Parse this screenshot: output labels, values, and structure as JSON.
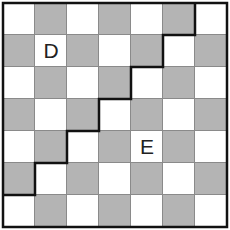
{
  "grid": {
    "rows": 7,
    "cols": 7,
    "cell_size": 32,
    "origin": [
      3,
      3
    ],
    "pattern": "checkerboard",
    "top_left_color": "white",
    "colors": {
      "light": "#ffffff",
      "dark": "#b4b4b4",
      "line": "#8a8a8a",
      "border": "#111111"
    }
  },
  "labels": [
    {
      "text": "D",
      "row": 1,
      "col": 1
    },
    {
      "text": "E",
      "row": 4,
      "col": 4
    }
  ],
  "staircase_path": {
    "description": "Thick dividing line descending in steps from top edge to left edge",
    "points_grid": [
      [
        6,
        0
      ],
      [
        6,
        1
      ],
      [
        5,
        1
      ],
      [
        5,
        2
      ],
      [
        4,
        2
      ],
      [
        4,
        3
      ],
      [
        3,
        3
      ],
      [
        3,
        4
      ],
      [
        2,
        4
      ],
      [
        2,
        5
      ],
      [
        1,
        5
      ],
      [
        1,
        6
      ],
      [
        0,
        6
      ]
    ]
  }
}
